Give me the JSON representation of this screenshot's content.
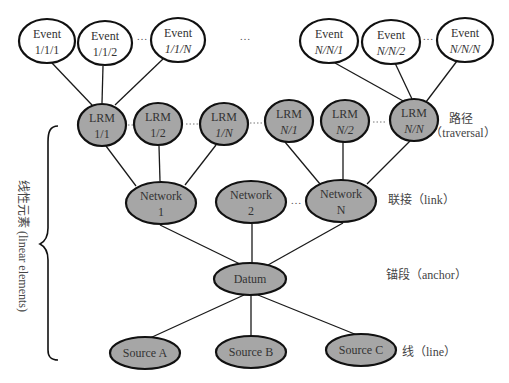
{
  "diagram": {
    "type": "hierarchy",
    "events": [
      {
        "line1": "Event",
        "line2": "1/1/1"
      },
      {
        "line1": "Event",
        "line2": "1/1/2"
      },
      {
        "line1": "Event",
        "line2": "1/1/N"
      },
      {
        "line1": "Event",
        "line2": "N/N/1"
      },
      {
        "line1": "Event",
        "line2": "N/N/2"
      },
      {
        "line1": "Event",
        "line2": "N/N/N"
      }
    ],
    "lrms": [
      {
        "line1": "LRM",
        "line2": "1/1"
      },
      {
        "line1": "LRM",
        "line2": "1/2"
      },
      {
        "line1": "LRM",
        "line2": "1/N"
      },
      {
        "line1": "LRM",
        "line2": "N/1"
      },
      {
        "line1": "LRM",
        "line2": "N/2"
      },
      {
        "line1": "LRM",
        "line2": "N/N"
      }
    ],
    "networks": [
      {
        "line1": "Network",
        "line2": "1"
      },
      {
        "line1": "Network",
        "line2": "2"
      },
      {
        "line1": "Network",
        "line2": "N"
      }
    ],
    "datum": {
      "label": "Datum"
    },
    "sources": [
      {
        "label": "Source A"
      },
      {
        "label": "Source B"
      },
      {
        "label": "Source C"
      }
    ],
    "ellipsis": "…",
    "level_labels": {
      "traversal_cn": "路径",
      "traversal_en": "（traversal）",
      "link": "联接（link）",
      "anchor": "锚段（anchor）",
      "line": "线（line）"
    },
    "brace_label": "线性元素 (linear elements)",
    "colors": {
      "event_fill": "#ffffff",
      "node_fill": "#a6a6a6",
      "stroke": "#111111"
    }
  }
}
